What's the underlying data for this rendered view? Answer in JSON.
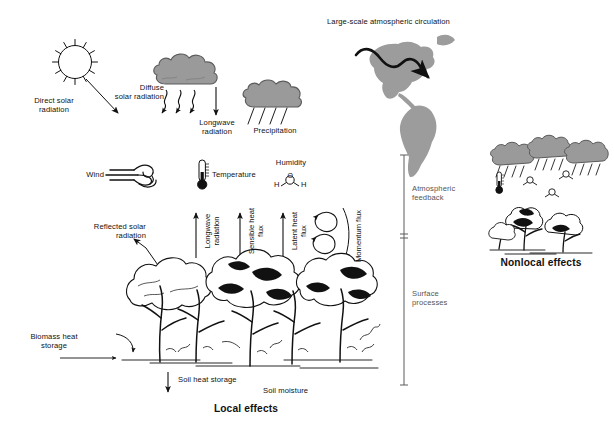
{
  "figure": {
    "title_local": "Local effects",
    "title_nonlocal": "Nonlocal effects",
    "background": "#ffffff",
    "ink": "#111111",
    "cloud_fill": "#9a9a9a",
    "cloud_stroke": "#5a5a5a",
    "map_fill": "#9c9c9c"
  },
  "atmosphere": {
    "circulation_label": "Large-scale atmospheric circulation",
    "sun_label": "Direct solar\nradiation",
    "diffuse_label": "Diffuse\nsolar radiation",
    "longwave_down_label": "Longwave\nradiation",
    "precipitation_label": "Precipitation",
    "wind_label": "Wind",
    "temperature_label": "Temperature",
    "humidity_label": "Humidity",
    "humidity_formula": {
      "left_atom": "H",
      "center_atom": "O",
      "right_atom": "H"
    }
  },
  "surface_fluxes": [
    {
      "label": "Longwave\nradiation",
      "direction": "up"
    },
    {
      "label": "Sensible heat\nflux",
      "direction": "up"
    },
    {
      "label": "Latent heat\nflux",
      "direction": "up"
    },
    {
      "label": "Momentum flux",
      "direction": "eddy"
    }
  ],
  "surface_labels": {
    "reflected": "Reflected solar\nradiation",
    "biomass": "Biomass heat\nstorage",
    "soil_heat": "Soil heat storage",
    "soil_moisture": "Soil moisture"
  },
  "bracket": {
    "upper_label": "Atmospheric\nfeedback",
    "lower_label": "Surface\nprocesses",
    "top_y": 155,
    "divider_y": 236,
    "bottom_y": 385,
    "x": 404
  },
  "nonlocal": {
    "cloud_count": 3,
    "molecule_count": 3,
    "molecule_atoms": {
      "left": "H",
      "center": "O",
      "right": "H"
    },
    "thermometer": true,
    "trees": true
  },
  "icons": {
    "sun": "sun-icon",
    "cloud": "cloud-icon",
    "rain_cloud": "rain-cloud-icon",
    "wind": "wind-icon",
    "thermometer": "thermometer-icon",
    "water_molecule": "water-molecule-icon",
    "globe_americas": "globe-americas-icon",
    "eddy": "eddy-icon",
    "forest": "forest-icon"
  }
}
